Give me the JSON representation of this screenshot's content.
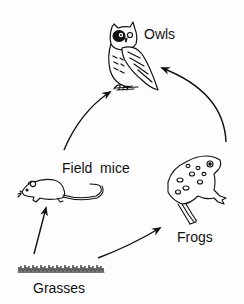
{
  "diagram": {
    "type": "food-chain",
    "nodes": [
      {
        "id": "owls",
        "label": "Owls",
        "icon": "owl-icon"
      },
      {
        "id": "field_mice",
        "label": "Field  mice",
        "icon": "mouse-icon"
      },
      {
        "id": "frogs",
        "label": "Frogs",
        "icon": "frog-icon"
      },
      {
        "id": "grasses",
        "label": "Grasses",
        "icon": "grass-icon"
      }
    ],
    "edges": [
      {
        "from": "Grasses",
        "to": "Field mice"
      },
      {
        "from": "Grasses",
        "to": "Frogs"
      },
      {
        "from": "Field mice",
        "to": "Owls"
      },
      {
        "from": "Frogs",
        "to": "Owls"
      }
    ],
    "colors": {
      "ink": "#111111",
      "background": "#fdfdfd"
    }
  }
}
